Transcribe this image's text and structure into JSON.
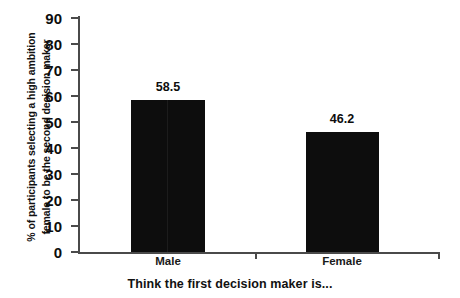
{
  "chart_data": {
    "type": "bar",
    "title": "",
    "xlabel": "Think the first decision maker is...",
    "ylabel_line1": "% of participants selecting a high ambition",
    "ylabel_line2": "female to be the second decision maker",
    "categories": [
      "Male",
      "Female"
    ],
    "values": [
      58.5,
      46.2
    ],
    "value_labels": [
      "58.5",
      "46.2"
    ],
    "ylim": [
      0,
      90
    ],
    "ytick_step": 10,
    "yticks": [
      0,
      10,
      20,
      30,
      40,
      50,
      60,
      70,
      80,
      90
    ],
    "ytick_labels": [
      "0",
      "10",
      "20",
      "30",
      "40",
      "50",
      "60",
      "70",
      "80",
      "90"
    ],
    "grid": false,
    "legend": false,
    "bar_color": "#0d0d0d",
    "axis_color": "#4a4a4a",
    "background_color": "#ffffff"
  }
}
